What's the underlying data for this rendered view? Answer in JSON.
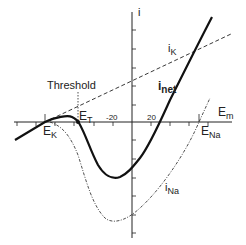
{
  "diagram": {
    "axes": {
      "x_label": "E",
      "x_label_sub": "m",
      "y_label": "i",
      "x_ticks": [
        "-20",
        "20"
      ]
    },
    "labels": {
      "threshold": "Threshold",
      "ek": "E",
      "ek_sub": "K",
      "et": "E",
      "et_sub": "T",
      "ena": "E",
      "ena_sub": "Na",
      "ik": "i",
      "ik_sub": "K",
      "inet": "i",
      "inet_sub": "net",
      "ina": "i",
      "ina_sub": "Na"
    },
    "curves": [
      {
        "name": "i_K",
        "style": "dashed",
        "shape": "straight line through E_K, positive slope"
      },
      {
        "name": "i_net",
        "style": "solid-thick",
        "shape": "N-shaped; zero at E_K, E_T and near +25 mV"
      },
      {
        "name": "i_Na",
        "style": "dash-dot",
        "shape": "U-shaped inward current, minimum near -10 mV, reverses at E_Na"
      }
    ],
    "colors": {
      "ink": "#222222",
      "background": "#ffffff"
    }
  }
}
